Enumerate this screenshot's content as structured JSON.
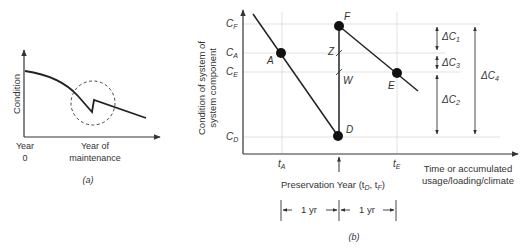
{
  "panel_a": {
    "caption": "(a)",
    "y_label": "Condition",
    "x_tick_0_line1": "Year",
    "x_tick_0_line2": "0",
    "x_tick_1_line1": "Year of",
    "x_tick_1_line2": "maintenance"
  },
  "panel_b": {
    "caption": "(b)",
    "y_label_line1": "Condition of system of",
    "y_label_line2": "system component",
    "x_label_line1": "Time or accumulated",
    "x_label_line2": "usage/loading/climate",
    "preservation_label": "Preservation Year (t",
    "preservation_sub_d": "D",
    "preservation_mid": ", t",
    "preservation_sub_f": "F",
    "preservation_end": ")",
    "y_ticks": [
      {
        "main": "C",
        "sub": "F"
      },
      {
        "main": "C",
        "sub": "A"
      },
      {
        "main": "C",
        "sub": "E"
      },
      {
        "main": "C",
        "sub": "D"
      }
    ],
    "x_ticks": [
      {
        "main": "t",
        "sub": "A"
      },
      {
        "main": "t",
        "sub": "E"
      }
    ],
    "points": [
      "A",
      "D",
      "F",
      "E"
    ],
    "markers": [
      "Z",
      "W"
    ],
    "deltas": [
      {
        "main": "ΔC",
        "sub": "1"
      },
      {
        "main": "ΔC",
        "sub": "3"
      },
      {
        "main": "ΔC",
        "sub": "2"
      },
      {
        "main": "ΔC",
        "sub": "4"
      }
    ],
    "interval_1": "1 yr",
    "interval_2": "1 yr"
  }
}
